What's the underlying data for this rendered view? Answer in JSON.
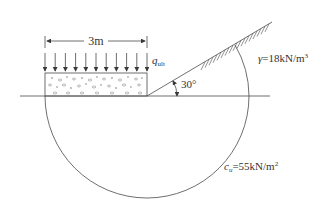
{
  "diagram": {
    "labels": {
      "width": "3m",
      "load_symbol": "q",
      "load_subscript": "ult",
      "slope_angle": "30°",
      "unit_weight_symbol": "γ",
      "unit_weight_value": "=18kN/m",
      "unit_weight_exp": "3",
      "cohesion_symbol": "c",
      "cohesion_subscript": "u",
      "cohesion_value": "=55kN/m",
      "cohesion_exp": "2"
    },
    "geometry": {
      "footing_width_m": 3,
      "slope_angle_deg": 30,
      "load_arrow_count": 11
    },
    "colors": {
      "line": "#4a4a4a",
      "text": "#333333",
      "background": "#ffffff"
    }
  }
}
